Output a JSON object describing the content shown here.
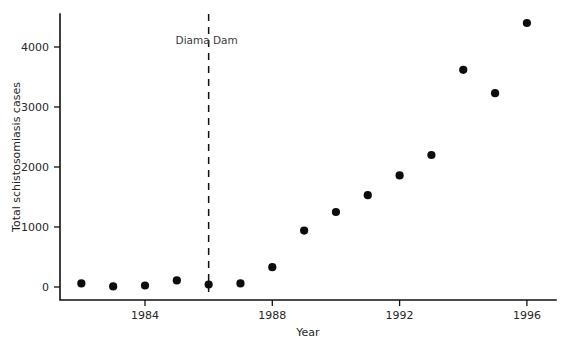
{
  "chart_data": {
    "type": "scatter",
    "title": "",
    "xlabel": "Year",
    "ylabel": "Total schistosomiasis cases",
    "xlim": [
      1981.3,
      1996.8
    ],
    "ylim": [
      -150,
      4650
    ],
    "grid": false,
    "legend": null,
    "x_ticks": [
      1984,
      1988,
      1992,
      1996
    ],
    "x_tick_labels": [
      "1984",
      "1988",
      "1992",
      "1996"
    ],
    "y_ticks": [
      0,
      1000,
      2000,
      3000,
      4000
    ],
    "y_tick_labels": [
      "0",
      "1000",
      "2000",
      "3000",
      "4000"
    ],
    "x": [
      1982,
      1983,
      1984,
      1985,
      1986,
      1987,
      1988,
      1989,
      1990,
      1991,
      1992,
      1993,
      1994,
      1995,
      1996
    ],
    "values": [
      60,
      10,
      25,
      110,
      40,
      60,
      330,
      940,
      1250,
      1530,
      1860,
      2200,
      3620,
      3230,
      4400
    ],
    "series": [
      {
        "name": "Total schistosomiasis cases",
        "marker": "circle",
        "color": "#0d0d0d",
        "values": [
          60,
          10,
          25,
          110,
          40,
          60,
          330,
          940,
          1250,
          1530,
          1860,
          2200,
          3620,
          3230,
          4400
        ]
      }
    ],
    "annotations": [
      {
        "name": "diama-dam",
        "label": "Diama Dam",
        "x": 1986,
        "type": "vertical-dashed-line",
        "label_y": 4050
      }
    ]
  },
  "axes": {
    "x_axis_title": "Year",
    "y_axis_title": "Total schistosomiasis cases"
  },
  "annotation": {
    "diama_dam_label": "Diama Dam"
  },
  "ticks": {
    "x": [
      "1984",
      "1988",
      "1992",
      "1996"
    ],
    "y": [
      "0",
      "1000",
      "2000",
      "3000",
      "4000"
    ]
  },
  "colors": {
    "marker": "#0d0d0d",
    "axis": "#111111",
    "text": "#262626",
    "background": "#ffffff"
  }
}
